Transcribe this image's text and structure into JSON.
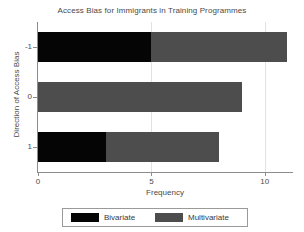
{
  "chart_data": {
    "type": "bar",
    "orientation": "horizontal",
    "stacked": true,
    "title": "Access Bias for Immigrants in Training Programmes",
    "xlabel": "Frequency",
    "ylabel": "Direction of Access Bias",
    "categories": [
      "-1",
      "0",
      "1"
    ],
    "series": [
      {
        "name": "Bivariate",
        "color": "#050505",
        "values": [
          5,
          0,
          3
        ]
      },
      {
        "name": "Multivariate",
        "color": "#4d4d4d",
        "values": [
          6,
          9,
          5
        ]
      }
    ],
    "totals": [
      11,
      9,
      8
    ],
    "xlim": [
      0,
      11.2
    ],
    "xticks": [
      "0",
      "5",
      "10"
    ],
    "xtick_values": [
      0,
      5,
      10
    ],
    "grid": "vertical-light",
    "legend_position": "bottom"
  },
  "legend": {
    "entries": [
      {
        "label": "Bivariate",
        "color": "#050505"
      },
      {
        "label": "Multivariate",
        "color": "#4d4d4d"
      }
    ]
  }
}
